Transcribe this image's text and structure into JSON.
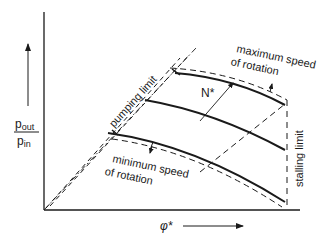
{
  "diagram": {
    "colors": {
      "ink": "#1a1a1a",
      "background": "#ffffff"
    },
    "axes": {
      "y_label_num": "p",
      "y_label_num_sub": "out",
      "y_label_den": "p",
      "y_label_den_sub": "in",
      "x_label": "φ*"
    },
    "labels": {
      "pumping_limit": "pumping limit",
      "max_speed_line1": "maximum speed",
      "max_speed_line2": "of rotation",
      "min_speed_line1": "minimum speed",
      "min_speed_line2": "of rotation",
      "stalling_limit": "stalling limit",
      "speed_param": "N*"
    },
    "curves": [
      {
        "name": "maximum-speed-curve",
        "style": "solid"
      },
      {
        "name": "intermediate-speed-curve",
        "style": "solid"
      },
      {
        "name": "minimum-speed-curve",
        "style": "solid"
      },
      {
        "name": "maximum-speed-limit",
        "style": "dashed"
      },
      {
        "name": "minimum-speed-limit",
        "style": "dashed"
      },
      {
        "name": "pumping-limit",
        "style": "dashed"
      },
      {
        "name": "stalling-limit",
        "style": "dashed"
      },
      {
        "name": "operating-line",
        "style": "dash-dot"
      }
    ]
  }
}
